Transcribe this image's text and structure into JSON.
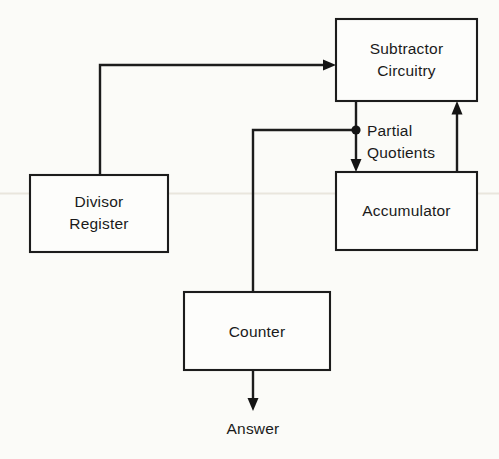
{
  "diagram": {
    "background_color": "#fbfbf8",
    "line_color": "#1c1c1c",
    "text_color": "#1a1a1a",
    "nodes": [
      {
        "id": "subtractor",
        "label_line1": "Subtractor",
        "label_line2": "Circuitry",
        "x": 336,
        "y": 19,
        "width": 141,
        "height": 82
      },
      {
        "id": "accumulator",
        "label_line1": "Accumulator",
        "label_line2": "",
        "x": 336,
        "y": 172,
        "width": 141,
        "height": 78
      },
      {
        "id": "divisor_register",
        "label_line1": "Divisor",
        "label_line2": "Register",
        "x": 30,
        "y": 175,
        "width": 138,
        "height": 77
      },
      {
        "id": "counter",
        "label_line1": "Counter",
        "label_line2": "",
        "x": 184,
        "y": 292,
        "width": 146,
        "height": 78
      }
    ],
    "edge_labels": [
      {
        "id": "partial_quotients",
        "line1": "Partial",
        "line2": "Quotients",
        "x": 367,
        "y": 130
      }
    ],
    "terminal_labels": [
      {
        "id": "answer",
        "text": "Answer",
        "x": 253,
        "y": 429
      }
    ],
    "junctions": [
      {
        "id": "partial-quotients-junction",
        "x": 356,
        "y": 130,
        "radius": 4.6
      }
    ],
    "edges": [
      {
        "id": "divisor-to-subtractor",
        "from": "divisor_register",
        "to": "subtractor",
        "arrow": "right"
      },
      {
        "id": "subtractor-to-accumulator",
        "from": "subtractor",
        "to": "accumulator",
        "arrow": "down"
      },
      {
        "id": "accumulator-to-subtractor",
        "from": "accumulator",
        "to": "subtractor",
        "arrow": "up"
      },
      {
        "id": "junction-to-counter",
        "from": "partial-quotients-junction",
        "to": "counter",
        "arrow": "none"
      },
      {
        "id": "counter-to-answer",
        "from": "counter",
        "to": "answer",
        "arrow": "down"
      }
    ]
  }
}
